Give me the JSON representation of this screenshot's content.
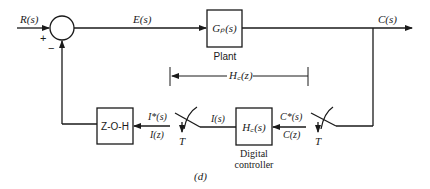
{
  "diagram": {
    "caption": "(d)",
    "signals": {
      "input": "R(s)",
      "error": "E(s)",
      "output": "C(s)",
      "sampled_output": "C*(s)",
      "sampled_output_z": "C(z)",
      "controller_output": "I(s)",
      "zoh_input": "I*(s)",
      "zoh_input_z": "I(z)"
    },
    "summing_junction": {
      "plus_sign": "+",
      "minus_sign": "−"
    },
    "blocks": {
      "plant": {
        "label": "Gₚ(s)",
        "caption": "Plant"
      },
      "controller": {
        "label": "H꜀(s)",
        "caption_line1": "Digital",
        "caption_line2": "controller"
      },
      "zoh": {
        "label": "Z-O-H"
      }
    },
    "bracket": {
      "label": "H꜀(z)"
    },
    "samplers": {
      "left": {
        "label": "T"
      },
      "right": {
        "label": "T"
      }
    }
  }
}
